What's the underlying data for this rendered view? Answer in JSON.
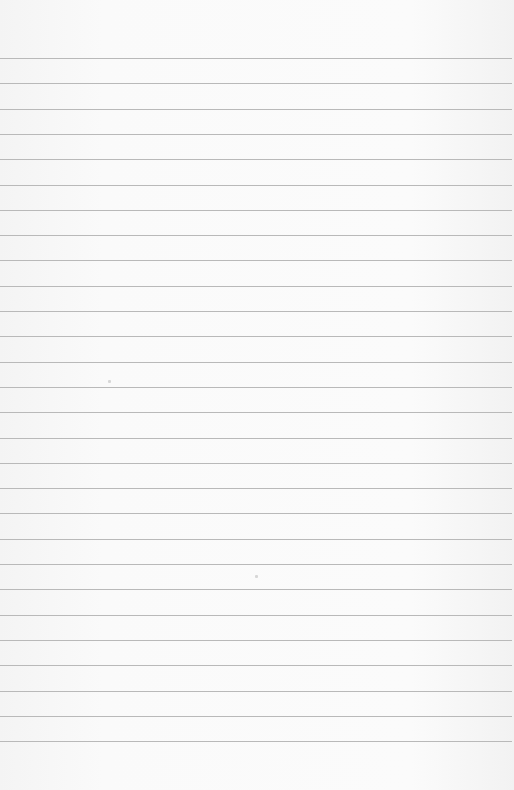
{
  "paper": {
    "type": "lined-paper",
    "background_color": "#f8f8f8",
    "line_color": "#b9b9b9",
    "line_count": 28,
    "first_line_y": 58,
    "line_spacing": 25.3
  }
}
